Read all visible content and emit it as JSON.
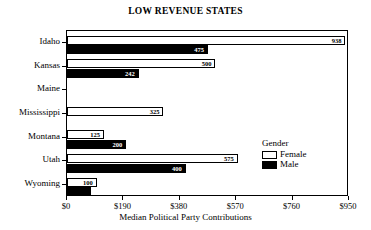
{
  "chart_data": {
    "type": "bar",
    "orientation": "horizontal",
    "title": "LOW REVENUE STATES",
    "xlabel": "Median Political Party Contributions",
    "ylabel": "",
    "xlim": [
      0,
      950
    ],
    "grid": false,
    "legend": {
      "title": "Gender",
      "position": "inside-right",
      "entries": [
        {
          "name": "Female",
          "color": "#ffffff",
          "swatch": "female"
        },
        {
          "name": "Male",
          "color": "#000000",
          "swatch": "male"
        }
      ]
    },
    "xticks": [
      0,
      190,
      380,
      570,
      760,
      950
    ],
    "xtick_labels": [
      "$0",
      "$190",
      "$380",
      "$570",
      "$760",
      "$950"
    ],
    "categories": [
      "Idaho",
      "Kansas",
      "Maine",
      "Mississippi",
      "Montana",
      "Utah",
      "Wyoming"
    ],
    "series": [
      {
        "name": "Female",
        "values": [
          938,
          500,
          null,
          325,
          125,
          575,
          100
        ],
        "labels": [
          "938",
          "500",
          "",
          "325",
          "125",
          "575",
          "100"
        ]
      },
      {
        "name": "Male",
        "values": [
          475,
          242,
          null,
          null,
          200,
          400,
          80
        ],
        "labels": [
          "475",
          "242",
          "",
          "",
          "200",
          "400",
          ""
        ]
      }
    ]
  },
  "colors": {
    "female": "#ffffff",
    "male": "#000000",
    "axis": "#000000",
    "background": "#ffffff"
  }
}
